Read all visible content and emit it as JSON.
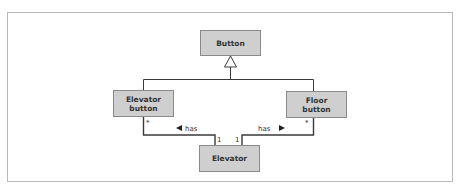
{
  "diagram": {
    "type": "UML class diagram",
    "classes": {
      "button": "Button",
      "elevator_button_line1": "Elevator",
      "elevator_button_line2": "button",
      "floor_button_line1": "Floor",
      "floor_button_line2": "button",
      "elevator": "Elevator"
    },
    "relationships": [
      {
        "type": "generalization",
        "from": "Elevator button",
        "to": "Button"
      },
      {
        "type": "generalization",
        "from": "Floor button",
        "to": "Button"
      },
      {
        "type": "association",
        "label": "has",
        "from": "Elevator",
        "to": "Elevator button",
        "multiplicity_from": "1",
        "multiplicity_to": "*"
      },
      {
        "type": "association",
        "label": "has",
        "from": "Elevator",
        "to": "Floor button",
        "multiplicity_from": "1",
        "multiplicity_to": "*"
      }
    ],
    "labels": {
      "has_left": "has",
      "has_right": "has",
      "mult_star_left": "*",
      "mult_star_right": "*",
      "mult_one_left": "1",
      "mult_one_right": "1"
    },
    "colors": {
      "box_fill": "#cfcfcf",
      "box_stroke": "#8a8a8a",
      "line": "#3a3a3a",
      "frame": "#b8b8b8"
    }
  }
}
